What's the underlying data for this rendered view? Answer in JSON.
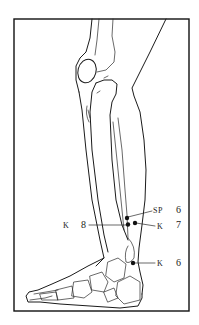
{
  "figure": {
    "type": "anatomical line drawing",
    "ink_color": "#1a1a1a",
    "background": "#ffffff"
  },
  "points": [
    {
      "id": "sp6",
      "meridian": "SP",
      "number": "6",
      "x": 127,
      "y": 218
    },
    {
      "id": "k8",
      "meridian": "K",
      "number": "8",
      "x": 128,
      "y": 224
    },
    {
      "id": "k7",
      "meridian": "K",
      "number": "7",
      "x": 135,
      "y": 223
    },
    {
      "id": "k6",
      "meridian": "K",
      "number": "6",
      "x": 133,
      "y": 263
    }
  ],
  "labels": {
    "sp6": {
      "meridian": "SP",
      "number": "6"
    },
    "k8": {
      "meridian": "K",
      "number": "8"
    },
    "k7": {
      "meridian": "K",
      "number": "7"
    },
    "k6": {
      "meridian": "K",
      "number": "6"
    }
  }
}
